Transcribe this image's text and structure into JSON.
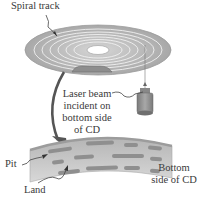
{
  "diagram": {
    "labels": {
      "spiral_track": "Spiral track",
      "laser_beam": [
        "Laser beam",
        "incident on",
        "bottom side",
        "of CD"
      ],
      "pit": "Pit",
      "land": "Land",
      "bottom_side": [
        "Bottom",
        "side of CD"
      ]
    },
    "colors": {
      "disc_fill": "#b9b9b9",
      "disc_edge": "#9a9a9a",
      "track_line": "#f2f2f2",
      "pit_fill": "#8f8f8f",
      "strip_fill": "#c2c2c2",
      "text": "#3a3a3a",
      "arrow": "#555555"
    }
  }
}
